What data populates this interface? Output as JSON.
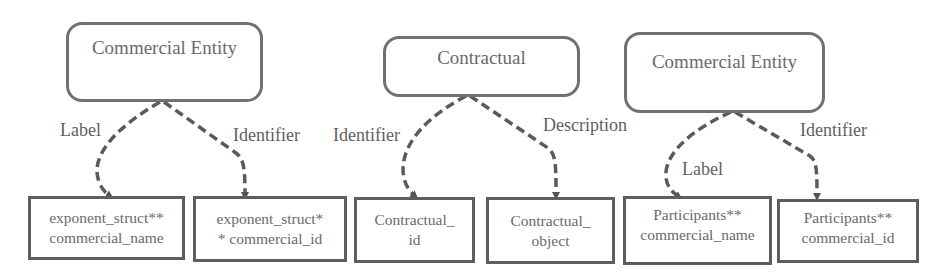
{
  "colors": {
    "stroke": "#5a5a5a",
    "text": "#6a6a6a",
    "background": "#ffffff"
  },
  "groups": [
    {
      "entity": {
        "label": "Commercial Entity"
      },
      "edges": [
        {
          "label": "Label",
          "target": "exponent_struct**\ncommercial_name"
        },
        {
          "label": "Identifier",
          "target": "exponent_struct*\n* commercial_id"
        }
      ]
    },
    {
      "entity": {
        "label": "Contractual"
      },
      "edges": [
        {
          "label": "Identifier",
          "target": "Contractual_\nid"
        },
        {
          "label": "Description",
          "target": "Contractual_\nobject"
        }
      ]
    },
    {
      "entity": {
        "label": "Commercial Entity"
      },
      "edges": [
        {
          "label": "Label",
          "target": "Participants**\ncommercial_name"
        },
        {
          "label": "Identifier",
          "target": "Participants**\ncommercial_id"
        }
      ]
    }
  ]
}
